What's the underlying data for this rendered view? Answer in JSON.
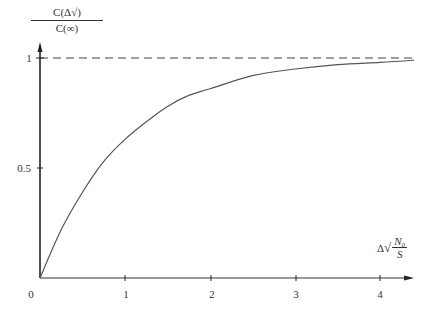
{
  "chart_data": {
    "type": "line",
    "title": "",
    "xlabel": "Δ√(N₀/S)",
    "ylabel": "C(Δ√)/C(∞)",
    "ylabel_numerator": "C(Δ√)",
    "ylabel_denominator": "C(∞)",
    "xlabel_prefix": "Δ",
    "xlabel_sqrt": "√",
    "xlabel_numerator": "N₀",
    "xlabel_denominator": "S",
    "xlim": [
      0,
      4.4
    ],
    "ylim": [
      0,
      1.05
    ],
    "grid": false,
    "x_ticks": [
      0,
      1,
      2,
      3,
      4
    ],
    "x_tick_labels": [
      "0",
      "1",
      "2",
      "3",
      "4"
    ],
    "y_ticks": [
      0.5,
      1
    ],
    "y_tick_labels": [
      "0.5",
      "1"
    ],
    "series": [
      {
        "name": "C(Δ√)/C(∞)",
        "style": "solid",
        "x": [
          0,
          0.25,
          0.5,
          0.75,
          1.0,
          1.25,
          1.5,
          1.75,
          2.0,
          2.5,
          3.0,
          3.5,
          4.0,
          4.4
        ],
        "values": [
          0,
          0.22,
          0.39,
          0.53,
          0.63,
          0.71,
          0.78,
          0.83,
          0.86,
          0.92,
          0.95,
          0.97,
          0.98,
          0.99
        ]
      },
      {
        "name": "asymptote",
        "style": "dashed",
        "x": [
          0,
          4.4
        ],
        "values": [
          1,
          1
        ]
      }
    ]
  }
}
